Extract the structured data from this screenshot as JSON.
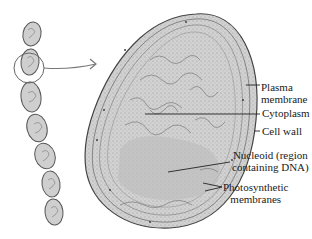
{
  "diagram": {
    "labels": {
      "plasma_membrane_1": "Plasma",
      "plasma_membrane_2": "membrane",
      "cytoplasm": "Cytoplasm",
      "cell_wall": "Cell wall",
      "nucleoid_1": "Nucleoid (region",
      "nucleoid_2": "containing DNA)",
      "photosynthetic_1": "Photosynthetic",
      "photosynthetic_2": "membranes"
    },
    "chain_cell_count": 8,
    "colors": {
      "outline": "#555555",
      "cell_fill": "#c9c9c9",
      "nucleoid_fill": "#b8b8b8",
      "arrow": "#777777",
      "text": "#1a1a1a"
    }
  }
}
